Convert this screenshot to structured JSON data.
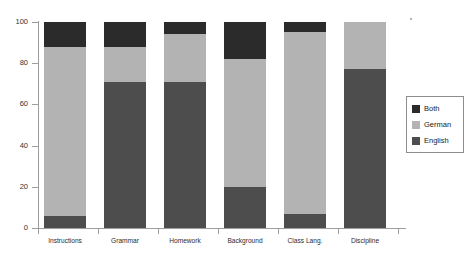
{
  "chart_data": {
    "type": "bar",
    "subtype": "stacked-percent",
    "title": "",
    "xlabel": "",
    "ylabel": "",
    "ylim": [
      0,
      100
    ],
    "yticks": [
      0,
      20,
      40,
      60,
      80,
      100
    ],
    "ytick_labels": [
      "0",
      "20",
      "40",
      "60",
      "80",
      "100"
    ],
    "grid": false,
    "legend_position": "right",
    "categories": [
      "Instructions",
      "Grammar",
      "Homework",
      "Background",
      "Class Lang.",
      "Discipline"
    ],
    "series": [
      {
        "name": "English",
        "color": "#4d4d4d",
        "values": [
          6,
          71,
          71,
          20,
          7,
          77
        ]
      },
      {
        "name": "German",
        "color": "#b3b3b3",
        "values": [
          82,
          17,
          23,
          62,
          88,
          23
        ]
      },
      {
        "name": "Both",
        "color": "#2b2b2b",
        "values": [
          12,
          12,
          6,
          18,
          5,
          0
        ]
      }
    ]
  },
  "axes": {
    "y_tick_labels": [
      "100",
      "80",
      "60",
      "40",
      "20",
      "0"
    ],
    "y_tick_values": [
      100,
      80,
      60,
      40,
      20,
      0
    ]
  },
  "legend": {
    "entries": [
      {
        "label": "Both",
        "color": "#2b2b2b"
      },
      {
        "label": "German",
        "color": "#b3b3b3"
      },
      {
        "label": "English",
        "color": "#4d4d4d"
      }
    ]
  },
  "colors": {
    "both": "#2b2b2b",
    "german": "#b3b3b3",
    "english": "#4d4d4d",
    "axis": "#9d9d9d",
    "text": "#2b2b2b",
    "background": "#ffffff"
  }
}
